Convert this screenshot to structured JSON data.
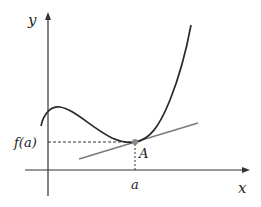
{
  "diagram": {
    "type": "function-tangent-plot",
    "labels": {
      "y_axis": "y",
      "x_axis": "x",
      "x_tick": "a",
      "y_tick": "f(a)",
      "point": "A"
    },
    "colors": {
      "curve": "#2a2a2a",
      "tangent": "#7a7a7a",
      "axes": "#333333",
      "point": "#8a8a8a",
      "guides": "#333333"
    }
  }
}
